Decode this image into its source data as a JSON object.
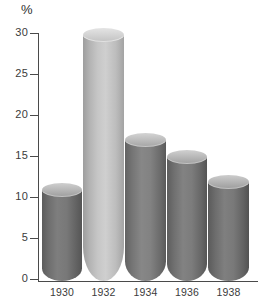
{
  "chart_data": {
    "type": "bar",
    "title": "",
    "subtitle": "",
    "xlabel": "",
    "ylabel": "%",
    "unit_label": "%",
    "categories": [
      "1930",
      "1932",
      "1934",
      "1936",
      "1938"
    ],
    "values": [
      11,
      29.8,
      17,
      15,
      12
    ],
    "ylim": [
      0,
      30
    ],
    "y_ticks": [
      0,
      5,
      10,
      15,
      20,
      25,
      30
    ],
    "y_tick_labels": [
      "0",
      "5",
      "10",
      "15",
      "20",
      "25",
      "30"
    ],
    "grid": false,
    "legend": null,
    "legend_position": "none",
    "annotations": [],
    "style": "3d-cylinder-bars",
    "series": [
      {
        "name": "",
        "values": [
          11,
          29.8,
          17,
          15,
          12
        ]
      }
    ],
    "bar_colors": [
      "#6e6e6e",
      "#b8b8b8",
      "#757575",
      "#6e6e6e",
      "#6b6b6b"
    ],
    "bar_top_colors": [
      "#a8a8a8",
      "#d8d8d8",
      "#b0b0b0",
      "#a8a8a8",
      "#a5a5a5"
    ]
  },
  "axis": {
    "unit": "%",
    "y_labels": [
      "30",
      "25",
      "20",
      "15",
      "10",
      "5",
      "0"
    ],
    "x_labels": [
      "1930",
      "1932",
      "1934",
      "1936",
      "1938"
    ]
  },
  "colors": {
    "background": "#ffffff",
    "axis": "#4a4a4a",
    "text": "#3b3b3b",
    "bar_dark": "#6e6e6e",
    "bar_light": "#b8b8b8"
  }
}
